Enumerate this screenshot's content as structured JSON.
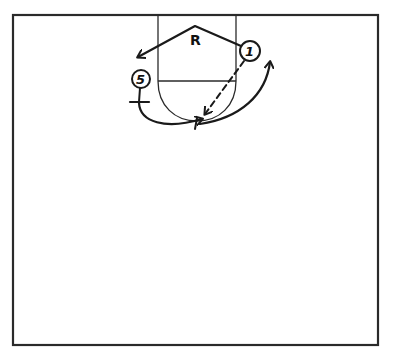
{
  "diagram": {
    "type": "basketball-play",
    "colors": {
      "background": "#ffffff",
      "ink": "#1a1a1a"
    },
    "court": {
      "x": 13,
      "y": 15,
      "width": 365,
      "height": 330
    },
    "lane": {
      "left_x": 158,
      "right_x": 236,
      "free_throw_y": 81,
      "semicircle_bottom_y": 121
    },
    "markers": [
      {
        "id": "rebounder",
        "label": "R",
        "x": 196,
        "y": 44
      }
    ],
    "players": [
      {
        "id": "player-5",
        "label": "5",
        "cx": 141,
        "cy": 79,
        "r": 9
      },
      {
        "id": "player-1",
        "label": "1",
        "cx": 250,
        "cy": 51,
        "r": 10
      }
    ],
    "actions": [
      {
        "id": "r-movement",
        "kind": "cut",
        "description": "Path from player 1 up to apex near R then down-left toward left wing"
      },
      {
        "id": "pass-1",
        "kind": "pass",
        "style": "dashed",
        "from": "1",
        "description": "Dashed pass from player 1 down-left toward the low block"
      },
      {
        "id": "screen-5",
        "kind": "screen",
        "from": "5",
        "description": "Player 5 sets a screen (T-bar) then curls under the basket"
      },
      {
        "id": "cut-1",
        "kind": "cut",
        "from": "1",
        "description": "Curved cut from under basket up to the right wing"
      }
    ]
  }
}
